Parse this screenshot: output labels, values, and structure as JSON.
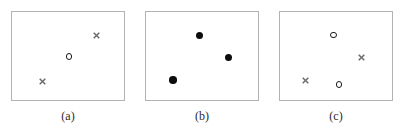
{
  "figure": {
    "width": 404,
    "height": 132,
    "background_color": "#ffffff",
    "box_border_color": "#b3b3b3",
    "cross_color": "#6b6b6b",
    "open_circle_color": "#1a1a1a",
    "filled_circle_color": "#0d0d0d",
    "caption_color": "#2b2b2b"
  },
  "panels": [
    {
      "id": "panel-a",
      "caption": "(a)",
      "caption_center_x": 68,
      "caption_y": 109,
      "box": {
        "x": 11,
        "y": 11,
        "width": 114,
        "height": 90
      },
      "markers": [
        {
          "name": "cross-top-right",
          "type": "cross",
          "x": 96.5,
          "y": 35.5,
          "size": 7
        },
        {
          "name": "open-circle-center",
          "type": "open-circle",
          "x": 69,
          "y": 56.5,
          "size": 6.5
        },
        {
          "name": "cross-bottom-left",
          "type": "cross",
          "x": 42,
          "y": 81.5,
          "size": 7
        }
      ]
    },
    {
      "id": "panel-b",
      "caption": "(b)",
      "caption_center_x": 202,
      "caption_y": 109,
      "box": {
        "x": 145,
        "y": 11,
        "width": 114,
        "height": 90
      },
      "markers": [
        {
          "name": "filled-circle-top",
          "type": "filled-circle",
          "x": 199.5,
          "y": 35.5,
          "size": 7.5
        },
        {
          "name": "filled-circle-right",
          "type": "filled-circle",
          "x": 228.5,
          "y": 57.5,
          "size": 7.5
        },
        {
          "name": "filled-circle-bottom-left",
          "type": "filled-circle",
          "x": 173,
          "y": 80,
          "size": 7.5
        }
      ]
    },
    {
      "id": "panel-c",
      "caption": "(c)",
      "caption_center_x": 336,
      "caption_y": 109,
      "box": {
        "x": 279,
        "y": 11,
        "width": 114,
        "height": 90
      },
      "markers": [
        {
          "name": "open-circle-top",
          "type": "open-circle",
          "x": 333.5,
          "y": 35,
          "size": 6.5
        },
        {
          "name": "cross-right",
          "type": "cross",
          "x": 361,
          "y": 57,
          "size": 7
        },
        {
          "name": "cross-bottom-left",
          "type": "cross",
          "x": 305.5,
          "y": 80.5,
          "size": 7
        },
        {
          "name": "open-circle-bottom",
          "type": "open-circle",
          "x": 339,
          "y": 84.5,
          "size": 6.5
        }
      ]
    }
  ]
}
